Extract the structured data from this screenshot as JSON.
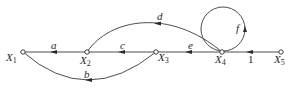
{
  "diagram": {
    "type": "signal-flow-graph",
    "nodes": [
      {
        "id": "X1",
        "name": "X",
        "sub": "1",
        "x": 23,
        "y": 52
      },
      {
        "id": "X2",
        "name": "X",
        "sub": "2",
        "x": 87,
        "y": 52
      },
      {
        "id": "X3",
        "name": "X",
        "sub": "3",
        "x": 156,
        "y": 52
      },
      {
        "id": "X4",
        "name": "X",
        "sub": "4",
        "x": 222,
        "y": 52
      },
      {
        "id": "X5",
        "name": "X",
        "sub": "5",
        "x": 281,
        "y": 52
      }
    ],
    "edges": [
      {
        "id": "a",
        "from": "X1",
        "to": "X2",
        "label": "a"
      },
      {
        "id": "c",
        "from": "X2",
        "to": "X3",
        "label": "c"
      },
      {
        "id": "e",
        "from": "X3",
        "to": "X4",
        "label": "e"
      },
      {
        "id": "one",
        "from": "X4",
        "to": "X5",
        "label": "1"
      },
      {
        "id": "b",
        "from": "X1",
        "to": "X3",
        "label": "b"
      },
      {
        "id": "d",
        "from": "X2",
        "to": "X4",
        "label": "d"
      },
      {
        "id": "f",
        "from": "X4",
        "to": "X4",
        "label": "f"
      }
    ],
    "colors": {
      "line": "#3a3a3a",
      "background": "#ffffff"
    }
  }
}
